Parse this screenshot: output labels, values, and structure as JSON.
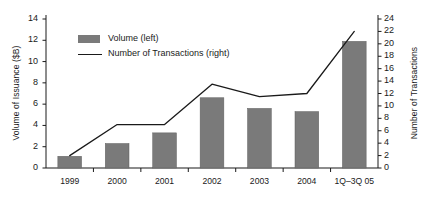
{
  "chart_data": {
    "type": "bar",
    "title": "",
    "subtitle": "",
    "xlabel": "",
    "ylabel": "Volume of Issuance ($B)",
    "y2label": "Number of Transactions",
    "categories": [
      "1999",
      "2000",
      "2001",
      "2002",
      "2003",
      "2004",
      "1Q–3Q 05"
    ],
    "grid": false,
    "legend_position": "upper-left-inside",
    "ylim": [
      0,
      14
    ],
    "y2lim": [
      0,
      24
    ],
    "yticks": [
      "0",
      "2",
      "4",
      "6",
      "8",
      "10",
      "12",
      "14"
    ],
    "ytick_values": [
      0,
      2,
      4,
      6,
      8,
      10,
      12,
      14
    ],
    "y2ticks": [
      "0",
      "2",
      "4",
      "6",
      "8",
      "10",
      "12",
      "14",
      "16",
      "18",
      "20",
      "22",
      "24"
    ],
    "y2tick_values": [
      0,
      2,
      4,
      6,
      8,
      10,
      12,
      14,
      16,
      18,
      20,
      22,
      24
    ],
    "series": [
      {
        "name": "Volume (left)",
        "type": "bar",
        "axis": "left",
        "color": "#7a7a7a",
        "values": [
          1.1,
          2.3,
          3.3,
          6.6,
          5.6,
          5.3,
          11.9
        ]
      },
      {
        "name": "Number of Transactions (right)",
        "type": "line",
        "axis": "right",
        "color": "#1a1a1a",
        "values": [
          2,
          7,
          7,
          13.5,
          11.5,
          12,
          22
        ]
      }
    ]
  },
  "legend": {
    "items": [
      {
        "label": "Volume (left)",
        "marker": "swatch",
        "color": "#7a7a7a"
      },
      {
        "label": "Number of Transactions (right)",
        "marker": "line",
        "color": "#1a1a1a"
      }
    ]
  },
  "colors": {
    "bar": "#7a7a7a",
    "line": "#1a1a1a",
    "axis": "#1a1a1a",
    "background": "#ffffff"
  }
}
